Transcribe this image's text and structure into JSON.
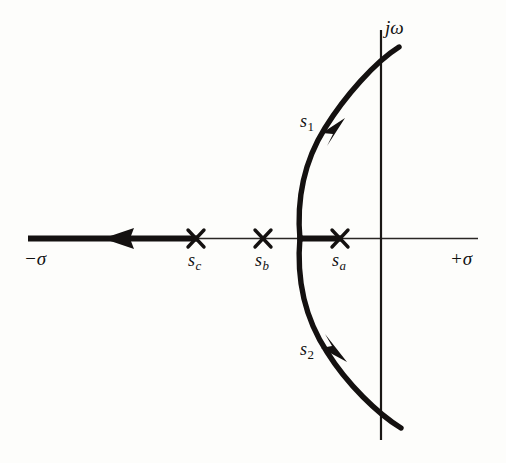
{
  "figure": {
    "kind": "root-locus-plot",
    "background_color": "#fdfdfb",
    "ink_color": "#111111"
  },
  "axes": {
    "real": {
      "negative_label": "−σ",
      "positive_label": "+σ",
      "y": 238,
      "x_start": 28,
      "x_end": 478
    },
    "imaginary": {
      "label": "jω",
      "x": 381,
      "y_start": 30,
      "y_end": 440
    }
  },
  "poles": [
    {
      "id": "sc",
      "label": "s",
      "subscript": "c",
      "marker": "x-cross",
      "x": 196,
      "y": 238
    },
    {
      "id": "sb",
      "label": "s",
      "subscript": "b",
      "marker": "x-cross",
      "x": 263,
      "y": 238
    },
    {
      "id": "sa",
      "label": "s",
      "subscript": "a",
      "marker": "x-cross",
      "x": 340,
      "y": 238
    }
  ],
  "branches": [
    {
      "id": "s1",
      "label": "s",
      "subscript": "1",
      "direction": "upward-right",
      "arrow_at": {
        "x": 340,
        "y": 131
      }
    },
    {
      "id": "s2",
      "label": "s",
      "subscript": "2",
      "direction": "downward-right",
      "arrow_at": {
        "x": 340,
        "y": 348
      }
    }
  ],
  "real_axis_locus": {
    "description": "thick locus segments on the real axis",
    "arrow_direction": "left",
    "arrow_at": {
      "x": 118,
      "y": 238
    },
    "segments": [
      {
        "from_x": 28,
        "to_x": 197
      },
      {
        "from_x": 299,
        "to_x": 341
      }
    ]
  },
  "curve": {
    "description": "complex-conjugate locus branches leaving the real axis as a left-opening arc then sweeping right across the j-omega axis",
    "vertex": {
      "x": 300,
      "y": 238
    },
    "upper_end": {
      "x": 399,
      "y": 47
    },
    "lower_end": {
      "x": 401,
      "y": 428
    }
  }
}
